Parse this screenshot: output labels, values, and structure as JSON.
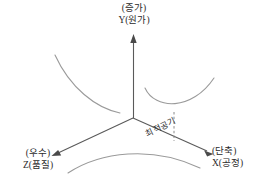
{
  "diagram": {
    "title_visible": false,
    "background_color": "#ffffff",
    "axis_color": "#5a5a5a",
    "curve_color": "#9a9a9a",
    "text_color": "#2b2b2b",
    "axes": {
      "y": {
        "direction_note": "(증가)",
        "name": "Y(원가)",
        "arrow": "up-arrow-icon"
      },
      "z": {
        "direction_note": "(우수)",
        "name": "Z(품질)",
        "arrow": "down-left-arrow-icon"
      },
      "x": {
        "direction_note": "(단축)",
        "name": "X(공정)",
        "arrow": "down-right-arrow-icon"
      }
    },
    "annotation": {
      "optimum_label": "최적공기"
    },
    "origin": {
      "x": 133,
      "y": 118
    },
    "curves": [
      {
        "name": "cost-curve-left",
        "path": "M 55 55 C 70 88, 96 108, 120 113"
      },
      {
        "name": "cost-curve-right-parabola",
        "path": "M 145 88 C 157 108, 190 110, 214 78"
      },
      {
        "name": "quality-process-arch",
        "path": "M 68 173 C 100 152, 150 145, 200 168"
      }
    ],
    "drop_line": {
      "name": "optimum-drop-line",
      "from": {
        "x": 174,
        "y": 113
      },
      "to": {
        "x": 174,
        "y": 141
      },
      "style": "dashed"
    }
  }
}
